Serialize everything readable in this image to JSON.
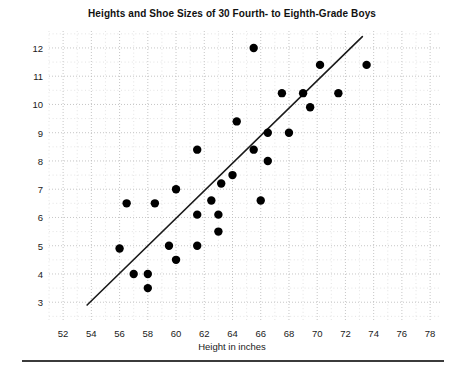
{
  "chart_data": {
    "type": "scatter",
    "title": "Heights and Shoe Sizes of 30 Fourth- to Eighth-Grade Boys",
    "xlabel": "Height in inches",
    "ylabel": "Shoe size",
    "xlim": [
      51,
      78.7
    ],
    "ylim": [
      2.3,
      12.6
    ],
    "xticks": [
      52,
      54,
      56,
      58,
      60,
      62,
      64,
      66,
      68,
      70,
      72,
      74,
      76,
      78
    ],
    "yticks": [
      3,
      4,
      5,
      6,
      7,
      8,
      9,
      10,
      11,
      12
    ],
    "grid": true,
    "grid_style": "dotted",
    "grid_minor_step_x": 1,
    "grid_minor_step_y": 0.5,
    "legend": null,
    "point_color": "#000000",
    "point_radius": 4.2,
    "line_color": "#1a1a1a",
    "points": [
      {
        "x": 56.0,
        "y": 4.9
      },
      {
        "x": 57.0,
        "y": 4.0
      },
      {
        "x": 58.0,
        "y": 4.0
      },
      {
        "x": 58.0,
        "y": 3.5
      },
      {
        "x": 56.5,
        "y": 6.5
      },
      {
        "x": 58.5,
        "y": 6.5
      },
      {
        "x": 59.5,
        "y": 5.0
      },
      {
        "x": 60.0,
        "y": 7.0
      },
      {
        "x": 60.0,
        "y": 4.5
      },
      {
        "x": 61.5,
        "y": 5.0
      },
      {
        "x": 61.5,
        "y": 8.4
      },
      {
        "x": 61.5,
        "y": 6.1
      },
      {
        "x": 62.5,
        "y": 6.6
      },
      {
        "x": 63.0,
        "y": 5.5
      },
      {
        "x": 63.0,
        "y": 6.1
      },
      {
        "x": 63.2,
        "y": 7.2
      },
      {
        "x": 64.0,
        "y": 7.5
      },
      {
        "x": 64.3,
        "y": 9.4
      },
      {
        "x": 65.5,
        "y": 12.0
      },
      {
        "x": 65.5,
        "y": 8.4
      },
      {
        "x": 66.0,
        "y": 6.6
      },
      {
        "x": 66.5,
        "y": 9.0
      },
      {
        "x": 66.5,
        "y": 8.0
      },
      {
        "x": 67.5,
        "y": 10.4
      },
      {
        "x": 68.0,
        "y": 9.0
      },
      {
        "x": 69.0,
        "y": 10.4
      },
      {
        "x": 69.5,
        "y": 9.9
      },
      {
        "x": 70.2,
        "y": 11.4
      },
      {
        "x": 71.5,
        "y": 10.4
      },
      {
        "x": 73.5,
        "y": 11.4
      }
    ],
    "trend_line": {
      "x1": 53.7,
      "y1": 2.9,
      "x2": 73.2,
      "y2": 12.4
    }
  }
}
